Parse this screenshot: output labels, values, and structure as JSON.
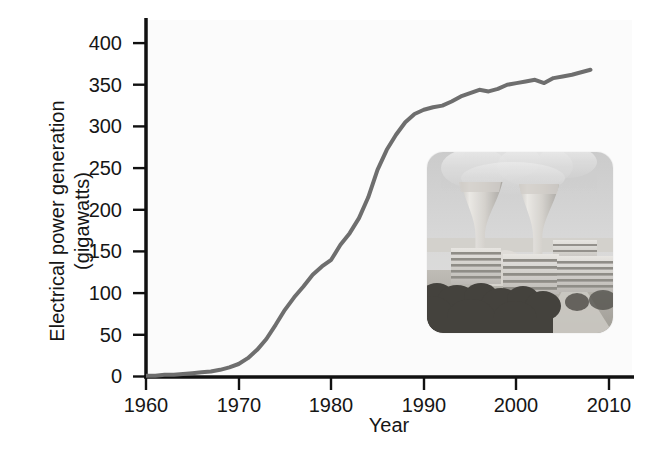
{
  "figure": {
    "background_color": "#ffffff",
    "axis_color": "#111111",
    "line_color": "#6e6e6e",
    "text_color": "#161616"
  },
  "chart_data": {
    "type": "line",
    "title": "",
    "subtitle": "",
    "xlabel": "Year",
    "ylabel": "Electrical power generation (gigawatts)",
    "ylabel_line1": "Electrical power generation",
    "ylabel_line2": "(gigawatts)",
    "xlim": [
      1960,
      2010
    ],
    "ylim": [
      0,
      400
    ],
    "xticks": [
      1960,
      1970,
      1980,
      1990,
      2000,
      2010
    ],
    "xtick_labels": [
      "1960",
      "1970",
      "1980",
      "1990",
      "2000",
      "2010"
    ],
    "yticks": [
      0,
      50,
      100,
      150,
      200,
      250,
      300,
      350,
      400
    ],
    "ytick_labels": [
      "0",
      "50",
      "100",
      "150",
      "200",
      "250",
      "300",
      "350",
      "400"
    ],
    "grid": false,
    "legend": false,
    "legend_position": "none",
    "series": [
      {
        "name": "Nuclear electrical power generation",
        "color": "#6e6e6e",
        "line_width": 4,
        "x": [
          1960,
          1961,
          1962,
          1963,
          1964,
          1965,
          1966,
          1967,
          1968,
          1969,
          1970,
          1971,
          1972,
          1973,
          1974,
          1975,
          1976,
          1977,
          1978,
          1979,
          1980,
          1981,
          1982,
          1983,
          1984,
          1985,
          1986,
          1987,
          1988,
          1989,
          1990,
          1991,
          1992,
          1993,
          1994,
          1995,
          1996,
          1997,
          1998,
          1999,
          2000,
          2001,
          2002,
          2003,
          2004,
          2005,
          2006,
          2007,
          2008
        ],
        "values": [
          1,
          1,
          2,
          2,
          3,
          4,
          5,
          6,
          8,
          11,
          15,
          22,
          32,
          45,
          62,
          80,
          95,
          108,
          122,
          132,
          140,
          158,
          172,
          190,
          215,
          248,
          272,
          290,
          305,
          315,
          320,
          323,
          325,
          330,
          336,
          340,
          344,
          342,
          345,
          350,
          352,
          354,
          356,
          352,
          358,
          360,
          362,
          365,
          368
        ]
      }
    ],
    "annotations": [
      {
        "type": "inset-image",
        "name": "nuclear-power-plant-photo",
        "description": "Photograph of a nuclear power plant with two hyperbolic cooling towers venting steam, reactor buildings and a containment dome, trees in the foreground",
        "x_px": 427,
        "y_px": 152,
        "width_px": 186,
        "height_px": 181
      }
    ]
  },
  "axes": {
    "x_title": "Year",
    "y_title_line1": "Electrical power generation",
    "y_title_line2": "(gigawatts)"
  }
}
